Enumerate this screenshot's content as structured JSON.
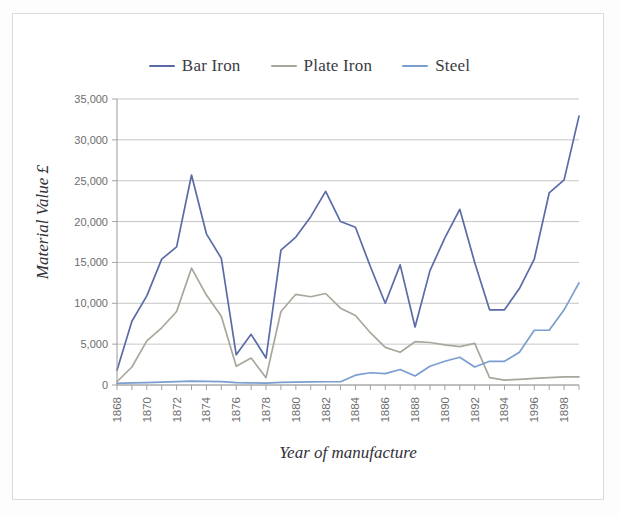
{
  "figure": {
    "background_color": "#ffffff",
    "border_color": "#dcdcdc"
  },
  "legend": {
    "position": "top-center",
    "items": [
      {
        "label": "Bar Iron",
        "color": "#5a6ba8",
        "swatch_name": "legend-swatch-bar-iron"
      },
      {
        "label": "Plate Iron",
        "color": "#a8a79c",
        "swatch_name": "legend-swatch-plate-iron"
      },
      {
        "label": "Steel",
        "color": "#7a9ed0",
        "swatch_name": "legend-swatch-steel"
      }
    ]
  },
  "axes": {
    "y_title": "Material Value £",
    "x_title": "Year of manufacture",
    "y_ticks": [
      "0",
      "5,000",
      "10,000",
      "15,000",
      "20,000",
      "25,000",
      "30,000",
      "35,000"
    ],
    "x_tick_labels": [
      "1868",
      "1870",
      "1872",
      "1874",
      "1876",
      "1878",
      "1880",
      "1882",
      "1884",
      "1886",
      "1888",
      "1890",
      "1892",
      "1894",
      "1996",
      "1898"
    ],
    "gridline_color": "#b8b8b8",
    "axis_color": "#9a9a9a"
  },
  "chart_data": {
    "type": "line",
    "title": "",
    "xlabel": "Year of manufacture",
    "ylabel": "Material Value £",
    "ylim": [
      0,
      35000
    ],
    "ytick_step": 5000,
    "grid": true,
    "legend_position": "top-center",
    "x": [
      1868,
      1869,
      1870,
      1871,
      1872,
      1873,
      1874,
      1875,
      1876,
      1877,
      1878,
      1879,
      1880,
      1881,
      1882,
      1883,
      1884,
      1885,
      1886,
      1887,
      1888,
      1889,
      1890,
      1891,
      1892,
      1893,
      1894,
      1895,
      1896,
      1897,
      1898,
      1899
    ],
    "x_tick_labels": [
      "1868",
      "",
      "1870",
      "",
      "1872",
      "",
      "1874",
      "",
      "1876",
      "",
      "1878",
      "",
      "1880",
      "",
      "1882",
      "",
      "1884",
      "",
      "1886",
      "",
      "1888",
      "",
      "1890",
      "",
      "1892",
      "",
      "1894",
      "",
      "1996",
      "",
      "1898",
      ""
    ],
    "series": [
      {
        "name": "Bar Iron",
        "color": "#5a6ba8",
        "values": [
          1800,
          7800,
          10900,
          15400,
          16900,
          25700,
          18500,
          15500,
          3700,
          6200,
          3300,
          16500,
          18100,
          20600,
          23700,
          20000,
          19300,
          14500,
          10000,
          14700,
          7100,
          14000,
          18000,
          21500,
          15000,
          9200,
          9200,
          11800,
          15400,
          23500,
          25100,
          32900
        ]
      },
      {
        "name": "Plate Iron",
        "color": "#a8a79c",
        "values": [
          400,
          2200,
          5400,
          7000,
          9000,
          14300,
          11000,
          8400,
          2300,
          3300,
          900,
          9000,
          11100,
          10800,
          11200,
          9400,
          8500,
          6400,
          4600,
          4000,
          5300,
          5200,
          4900,
          4700,
          5100,
          900,
          600,
          700,
          800,
          900,
          1000,
          1000
        ]
      },
      {
        "name": "Steel",
        "color": "#7a9ed0",
        "values": [
          200,
          250,
          300,
          350,
          420,
          480,
          450,
          420,
          300,
          260,
          220,
          330,
          360,
          380,
          400,
          400,
          1200,
          1500,
          1400,
          1900,
          1100,
          2300,
          2900,
          3400,
          2200,
          2900,
          2900,
          4000,
          6700,
          6700,
          9200,
          12500
        ]
      }
    ]
  }
}
